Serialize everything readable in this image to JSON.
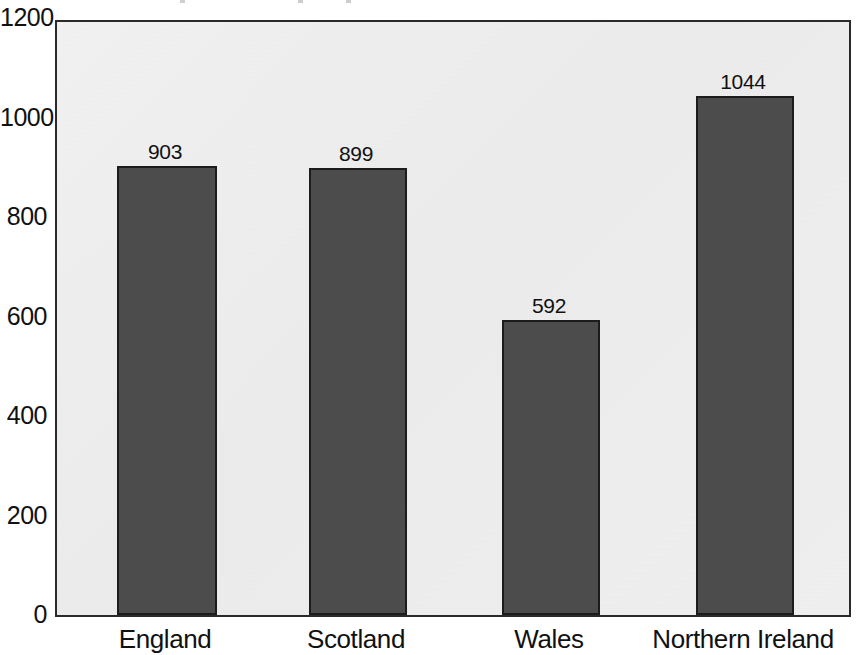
{
  "chart_data": {
    "type": "bar",
    "title": "",
    "xlabel": "",
    "ylabel": "",
    "categories": [
      "England",
      "Scotland",
      "Wales",
      "Northern Ireland"
    ],
    "values": [
      903,
      899,
      592,
      1044
    ],
    "data_labels": [
      "903",
      "899",
      "592",
      "1044"
    ],
    "ylim": [
      0,
      1200
    ],
    "y_ticks": [
      1200,
      1000,
      800,
      600,
      400,
      200,
      0
    ],
    "y_tick_labels": [
      "1200",
      "1000",
      "800",
      "600",
      "400",
      "200",
      "0"
    ],
    "grid": false,
    "legend": "none",
    "bar_color": "#4c4c4c",
    "bar_border_color": "#1c1c1c",
    "plot_background": "#efefef",
    "axis_color": "#2a2a2a",
    "text_color": "#111111"
  },
  "axis": {
    "y_labels": [
      {
        "text": "1200",
        "value": 1200
      },
      {
        "text": "1000",
        "value": 1000
      },
      {
        "text": "800",
        "value": 800
      },
      {
        "text": "600",
        "value": 600
      },
      {
        "text": "400",
        "value": 400
      },
      {
        "text": "200",
        "value": 200
      },
      {
        "text": "0",
        "value": 0
      }
    ],
    "x_labels": [
      {
        "text": "England"
      },
      {
        "text": "Scotland"
      },
      {
        "text": "Wales"
      },
      {
        "text": "Northern Ireland"
      }
    ]
  },
  "bars": [
    {
      "category": "England",
      "value": 903,
      "label": "903",
      "x": 115,
      "width": 100
    },
    {
      "category": "Scotland",
      "value": 899,
      "label": "899",
      "x": 307,
      "width": 98
    },
    {
      "category": "Wales",
      "value": 592,
      "label": "592",
      "x": 500,
      "width": 98
    },
    {
      "category": "Northern Ireland",
      "value": 1044,
      "label": "1044",
      "x": 694,
      "width": 98
    }
  ]
}
